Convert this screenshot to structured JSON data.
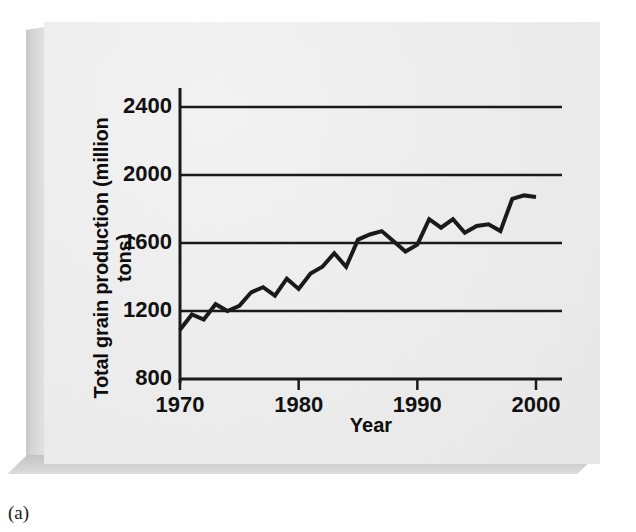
{
  "figure": {
    "caption": "(a)",
    "panel_color": "#ececec",
    "line_color": "#1a1a1a",
    "axis_color": "#1a1a1a"
  },
  "axis_titles": {
    "y": "Total grain production (million tons)",
    "x": "Year"
  },
  "chart_data": {
    "type": "line",
    "title": "",
    "subtitle": "",
    "xlabel": "Year",
    "ylabel": "Total grain production (million tons)",
    "xlim": [
      1970,
      2000
    ],
    "ylim": [
      800,
      2400
    ],
    "xticks": [
      1970,
      1980,
      1990,
      2000
    ],
    "yticks": [
      800,
      1200,
      1600,
      2000,
      2400
    ],
    "xtick_labels": [
      "1970",
      "1980",
      "1990",
      "2000"
    ],
    "ytick_labels": [
      "800",
      "1200",
      "1600",
      "2000",
      "2400"
    ],
    "grid": "horizontal",
    "legend": "none",
    "series": [
      {
        "name": "Total grain production",
        "x": [
          1970,
          1971,
          1972,
          1973,
          1974,
          1975,
          1976,
          1977,
          1978,
          1979,
          1980,
          1981,
          1982,
          1983,
          1984,
          1985,
          1986,
          1987,
          1988,
          1989,
          1990,
          1991,
          1992,
          1993,
          1994,
          1995,
          1996,
          1997,
          1998,
          1999,
          2000
        ],
        "values": [
          1090,
          1180,
          1150,
          1240,
          1200,
          1230,
          1310,
          1340,
          1290,
          1390,
          1330,
          1420,
          1460,
          1540,
          1460,
          1620,
          1650,
          1670,
          1610,
          1550,
          1590,
          1740,
          1690,
          1740,
          1660,
          1700,
          1710,
          1670,
          1860,
          1880,
          1870
        ]
      }
    ]
  }
}
